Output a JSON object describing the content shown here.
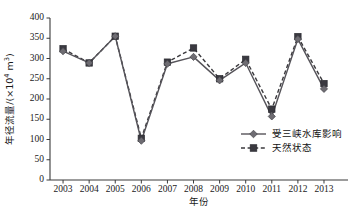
{
  "chart_data": {
    "type": "line",
    "title": "",
    "xlabel": "年份",
    "ylabel": "年径流量/(×10⁴ m³)",
    "ylabel_main": "年径流量/(×10",
    "ylabel_exp": "4",
    "ylabel_tail": " m",
    "ylabel_exp2": "3",
    "ylabel_close": ")",
    "categories": [
      "2003",
      "2004",
      "2005",
      "2006",
      "2007",
      "2008",
      "2009",
      "2010",
      "2011",
      "2012",
      "2013"
    ],
    "x": [
      2003,
      2004,
      2005,
      2006,
      2007,
      2008,
      2009,
      2010,
      2011,
      2012,
      2013
    ],
    "series": [
      {
        "name": "受三峡水库影响",
        "style": "solid",
        "marker": "diamond",
        "color": "#56545a",
        "values": [
          318,
          289,
          355,
          97,
          287,
          304,
          246,
          289,
          157,
          348,
          225
        ]
      },
      {
        "name": "天然状态",
        "style": "dashed",
        "marker": "square",
        "color": "#3b3a3e",
        "values": [
          324,
          289,
          355,
          103,
          291,
          326,
          250,
          298,
          175,
          354,
          238
        ]
      }
    ],
    "ylim": [
      0,
      400
    ],
    "yticks": [
      0,
      50,
      100,
      150,
      200,
      250,
      300,
      350,
      400
    ],
    "ytick_labels": [
      "0",
      "50",
      "100",
      "150",
      "200",
      "250",
      "300",
      "350",
      "400"
    ],
    "grid": false,
    "legend_position": "inside-bottom-right",
    "legend_entries": [
      "受三峡水库影响",
      "天然状态"
    ]
  },
  "axis": {
    "y_title": "年径流量/(×104 m3)",
    "x_title": "年份"
  },
  "colors": {
    "axis": "#3a3a3a",
    "series_solid": "#56545a",
    "series_dashed": "#3b3a3e",
    "background": "#ffffff",
    "text": "#1a1a1a"
  }
}
